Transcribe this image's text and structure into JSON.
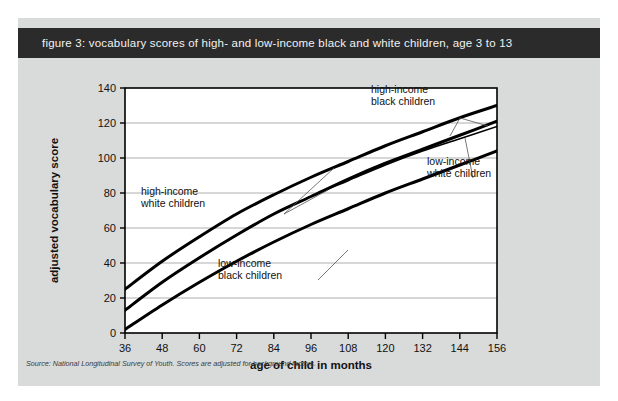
{
  "figure": {
    "title": "figure 3: vocabulary scores of high- and low-income black and white children, age 3 to 13",
    "source_note": "Source: National Longitudinal Survey of Youth. Scores are adjusted for background factors.",
    "panel_bg": "#d9dada",
    "title_bar_bg": "#2b2b2b",
    "title_color": "#f2f2f2",
    "plot_bg": "#ffffff",
    "line_color": "#000000",
    "grid_color": "#9a9a9a"
  },
  "chart_data": {
    "type": "line",
    "title": "figure 3: vocabulary scores of high- and low-income black and white children, age 3 to 13",
    "xlabel": "age of child in months",
    "ylabel": "adjusted vocabulary score",
    "xlim": [
      36,
      156
    ],
    "ylim": [
      0,
      140
    ],
    "xticks": [
      36,
      48,
      60,
      72,
      84,
      96,
      108,
      120,
      132,
      144,
      156
    ],
    "yticks": [
      0,
      20,
      40,
      60,
      80,
      100,
      120,
      140
    ],
    "grid": "horizontal",
    "legend": "annotations",
    "x": [
      36,
      48,
      60,
      72,
      84,
      96,
      108,
      120,
      132,
      144,
      156
    ],
    "series": [
      {
        "name": "high-income white children",
        "values": [
          25,
          41,
          55,
          68,
          79,
          89,
          98,
          107,
          115,
          123,
          130
        ]
      },
      {
        "name": "high-income black children",
        "values": [
          13,
          29,
          43,
          56,
          68,
          78,
          88,
          97,
          105,
          113,
          121
        ]
      },
      {
        "name": "low-income white children",
        "values": [
          13,
          29,
          43,
          56,
          68,
          78,
          87,
          96,
          104,
          111,
          118
        ]
      },
      {
        "name": "low-income black children",
        "values": [
          2,
          16,
          29,
          41,
          52,
          62,
          71,
          80,
          88,
          96,
          104
        ]
      }
    ],
    "annotations": [
      {
        "label_line1": "high-income",
        "label_line2": "black children",
        "x_px": 371,
        "y_px": 93
      },
      {
        "label_line1": "low-income",
        "label_line2": "white children",
        "x_px": 427,
        "y_px": 165
      },
      {
        "label_line1": "high-income",
        "label_line2": "white children",
        "x_px": 141,
        "y_px": 195
      },
      {
        "label_line1": "low-income",
        "label_line2": "black children",
        "x_px": 218,
        "y_px": 267
      }
    ]
  }
}
